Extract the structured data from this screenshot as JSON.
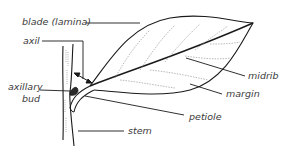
{
  "diagram": {
    "labels": {
      "blade": "blade (lamina)",
      "axil": "axil",
      "axillary_bud_line1": "axillary",
      "axillary_bud_line2": "bud",
      "stem": "stem",
      "midrib": "midrib",
      "margin": "margin",
      "petiole": "petiole"
    },
    "colors": {
      "line": "#1a1a1a",
      "text": "#3a3a3a",
      "vein": "#9a9a9a",
      "background": "#ffffff"
    }
  }
}
